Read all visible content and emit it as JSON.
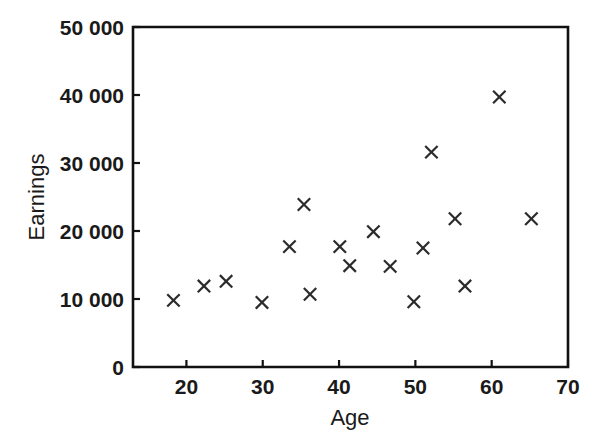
{
  "chart_data": {
    "type": "scatter",
    "title": "",
    "xlabel": "Age",
    "ylabel": "Earnings",
    "xlim": [
      13,
      70
    ],
    "ylim": [
      0,
      50000
    ],
    "grid": false,
    "legend": null,
    "marker": "x",
    "marker_color": "#2b2b2b",
    "xticks": [
      20,
      30,
      40,
      50,
      60,
      70
    ],
    "xtick_labels": [
      "20",
      "30",
      "40",
      "50",
      "60",
      "70"
    ],
    "yticks": [
      0,
      10000,
      20000,
      30000,
      40000,
      50000
    ],
    "ytick_labels": [
      "0",
      "10 000",
      "20 000",
      "30 000",
      "40 000",
      "50 000"
    ],
    "points": [
      {
        "x": 18.3,
        "y": 9800
      },
      {
        "x": 22.3,
        "y": 11900
      },
      {
        "x": 25.2,
        "y": 12600
      },
      {
        "x": 29.9,
        "y": 9500
      },
      {
        "x": 33.5,
        "y": 17700
      },
      {
        "x": 35.4,
        "y": 23900
      },
      {
        "x": 36.2,
        "y": 10700
      },
      {
        "x": 40.1,
        "y": 17700
      },
      {
        "x": 41.4,
        "y": 14900
      },
      {
        "x": 44.5,
        "y": 19900
      },
      {
        "x": 46.7,
        "y": 14800
      },
      {
        "x": 49.8,
        "y": 9600
      },
      {
        "x": 51.0,
        "y": 17500
      },
      {
        "x": 52.1,
        "y": 31600
      },
      {
        "x": 55.2,
        "y": 21800
      },
      {
        "x": 56.5,
        "y": 11900
      },
      {
        "x": 61.0,
        "y": 39700
      },
      {
        "x": 65.2,
        "y": 21800
      }
    ]
  },
  "axes": {
    "x_axis_name": "Age",
    "y_axis_name": "Earnings"
  }
}
